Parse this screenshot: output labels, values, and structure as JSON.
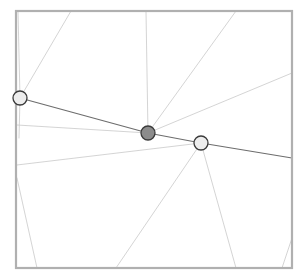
{
  "figure": {
    "name": "planar-graph-diagram",
    "type": "diagram",
    "width": 308,
    "height": 277,
    "background_color": "#ffffff"
  },
  "frame": {
    "name": "bounding-frame",
    "x": 16,
    "y": 11,
    "width": 276,
    "height": 257,
    "stroke_color": "#b0b0b0",
    "stroke_width": 2.2,
    "fill": "none"
  },
  "style": {
    "thin_edge_color": "#c9c9c9",
    "thin_edge_width": 0.8,
    "emphasized_edge_color": "#6d6d6d",
    "emphasized_edge_width": 1.2,
    "node_stroke_color": "#3a3a3a",
    "node_stroke_width": 1.3,
    "node_radius": 7,
    "node_light_fill": "#ededed",
    "node_dark_fill": "#8c8c8c"
  },
  "nodes": [
    {
      "id": "node-left",
      "label": "left-node",
      "cx": 20,
      "cy": 98,
      "r": 7,
      "fill": "#ededed",
      "state": "unselected"
    },
    {
      "id": "node-center",
      "label": "center-node",
      "cx": 148,
      "cy": 133,
      "r": 7,
      "fill": "#8c8c8c",
      "state": "selected"
    },
    {
      "id": "node-right",
      "label": "right-node",
      "cx": 201,
      "cy": 143,
      "r": 7,
      "fill": "#ededed",
      "state": "unselected"
    }
  ],
  "emphasized_path": {
    "name": "highlighted-path",
    "color": "#6d6d6d",
    "segments": [
      {
        "id": "seg-left-center",
        "x1": 20,
        "y1": 98,
        "x2": 148,
        "y2": 133
      },
      {
        "id": "seg-center-right",
        "x1": 148,
        "y1": 133,
        "x2": 201,
        "y2": 143
      },
      {
        "id": "seg-right-edge",
        "x1": 201,
        "y1": 143,
        "x2": 292,
        "y2": 158
      }
    ]
  },
  "edges": [
    {
      "id": "edge-1",
      "x1": 20,
      "y1": 98,
      "x2": 71,
      "y2": 11,
      "kind": "thin"
    },
    {
      "id": "edge-2",
      "x1": 20,
      "y1": 98,
      "x2": 18,
      "y2": 11,
      "kind": "thin"
    },
    {
      "id": "edge-3",
      "x1": 20,
      "y1": 98,
      "x2": 19,
      "y2": 138,
      "kind": "thin"
    },
    {
      "id": "edge-4",
      "x1": 148,
      "y1": 133,
      "x2": 146,
      "y2": 11,
      "kind": "thin"
    },
    {
      "id": "edge-5",
      "x1": 148,
      "y1": 133,
      "x2": 236,
      "y2": 11,
      "kind": "thin"
    },
    {
      "id": "edge-6",
      "x1": 148,
      "y1": 133,
      "x2": 292,
      "y2": 73,
      "kind": "thin"
    },
    {
      "id": "edge-7",
      "x1": 148,
      "y1": 133,
      "x2": 17,
      "y2": 125,
      "kind": "thin"
    },
    {
      "id": "edge-8",
      "x1": 201,
      "y1": 143,
      "x2": 17,
      "y2": 165,
      "kind": "thin"
    },
    {
      "id": "edge-9",
      "x1": 201,
      "y1": 143,
      "x2": 116,
      "y2": 268,
      "kind": "thin"
    },
    {
      "id": "edge-10",
      "x1": 201,
      "y1": 143,
      "x2": 236,
      "y2": 268,
      "kind": "thin"
    },
    {
      "id": "edge-11",
      "x1": 17,
      "y1": 178,
      "x2": 37,
      "y2": 268,
      "kind": "thin"
    },
    {
      "id": "edge-12",
      "x1": 292,
      "y1": 238,
      "x2": 282,
      "y2": 268,
      "kind": "thin"
    }
  ],
  "chart_data": {
    "type": "scatter",
    "title": "",
    "xlabel": "",
    "ylabel": "",
    "xlim": [
      16,
      292
    ],
    "ylim": [
      11,
      268
    ],
    "grid": false,
    "legend": "none",
    "points": [
      {
        "name": "left-node",
        "x": 20,
        "y": 98,
        "marker": "circle",
        "fill": "#ededed"
      },
      {
        "name": "center-node",
        "x": 148,
        "y": 133,
        "marker": "circle",
        "fill": "#8c8c8c"
      },
      {
        "name": "right-node",
        "x": 201,
        "y": 143,
        "marker": "circle",
        "fill": "#ededed"
      }
    ],
    "edge_count": 12,
    "node_count": 3
  }
}
